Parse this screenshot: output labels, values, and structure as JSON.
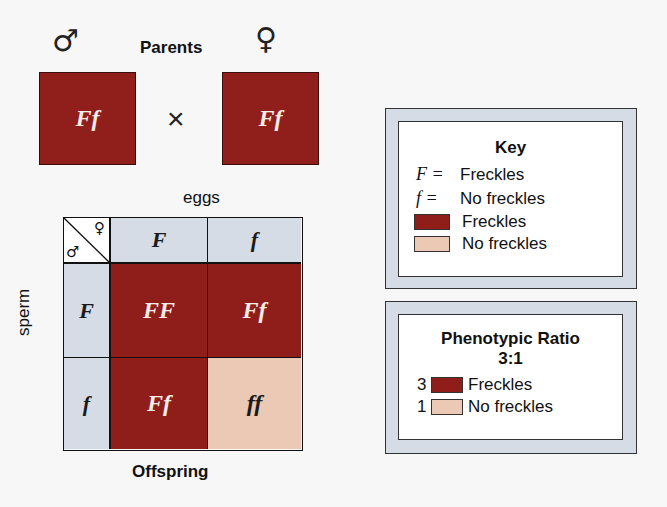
{
  "parents": {
    "title": "Parents",
    "male_symbol": "♂",
    "female_symbol": "♀",
    "male_genotype": "Ff",
    "female_genotype": "Ff",
    "cross_symbol": "×"
  },
  "punnett": {
    "column_label": "eggs",
    "row_label": "sperm",
    "corner_male": "♂",
    "corner_female": "♀",
    "columns": [
      "F",
      "f"
    ],
    "rows": [
      "F",
      "f"
    ],
    "cells": [
      [
        "FF",
        "Ff"
      ],
      [
        "Ff",
        "ff"
      ]
    ],
    "caption": "Offspring"
  },
  "key": {
    "title": "Key",
    "items": [
      {
        "symbol": "F =",
        "label": "Freckles"
      },
      {
        "symbol": "f =",
        "label": "No freckles"
      }
    ],
    "swatches": [
      {
        "color": "#8f1e1a",
        "label": "Freckles"
      },
      {
        "color": "#ecc9b5",
        "label": "No freckles"
      }
    ]
  },
  "ratio": {
    "title": "Phenotypic Ratio",
    "value": "3:1",
    "items": [
      {
        "count": "3",
        "color": "#8f1e1a",
        "label": "Freckles"
      },
      {
        "count": "1",
        "color": "#ecc9b5",
        "label": "No freckles"
      }
    ]
  },
  "colors": {
    "freckles": "#8f1e1a",
    "no_freckles": "#ecc9b5",
    "header_bg": "#d6dce6"
  }
}
